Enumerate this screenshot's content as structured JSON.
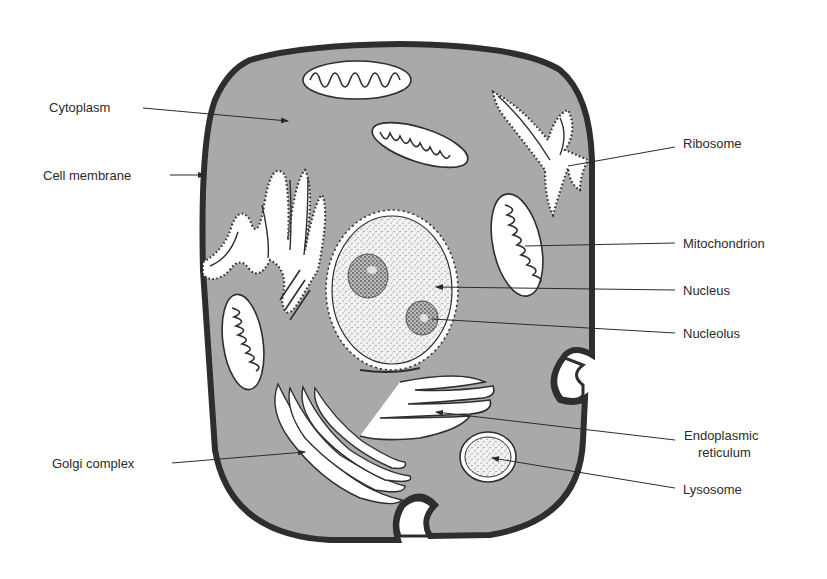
{
  "figure": {
    "colors": {
      "cytoplasm": "#a9a9a9",
      "membrane": "#2e2e2e",
      "organelle_fill": "#ffffff",
      "text": "#2b2b2b",
      "background": "#ffffff"
    }
  },
  "labels": {
    "left": [
      {
        "id": "cytoplasm",
        "text": "Cytoplasm"
      },
      {
        "id": "cell-membrane",
        "text": "Cell membrane"
      },
      {
        "id": "golgi-complex",
        "text": "Golgi complex"
      }
    ],
    "right": [
      {
        "id": "ribosome",
        "text": "Ribosome"
      },
      {
        "id": "mitochondrion",
        "text": "Mitochondrion"
      },
      {
        "id": "nucleus",
        "text": "Nucleus"
      },
      {
        "id": "nucleolus",
        "text": "Nucleolus"
      },
      {
        "id": "endoplasmic-reticulum",
        "text": "Endoplasmic",
        "text2": "reticulum"
      },
      {
        "id": "lysosome",
        "text": "Lysosome"
      }
    ]
  }
}
